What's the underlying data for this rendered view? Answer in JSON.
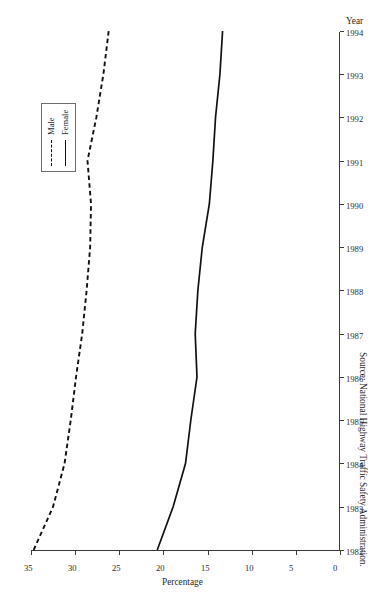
{
  "chart_data": {
    "type": "line",
    "title": "",
    "xlabel": "Year",
    "ylabel": "Percentage",
    "orientation": "rotated-90-ccw",
    "grid": false,
    "legend_position": "top-left-of-image",
    "x": [
      1982,
      1983,
      1984,
      1985,
      1986,
      1987,
      1988,
      1989,
      1990,
      1991,
      1992,
      1993,
      1994
    ],
    "xlim": [
      1982,
      1994
    ],
    "ylim": [
      0,
      35
    ],
    "xticks": [
      "1982",
      "1983",
      "1984",
      "1985",
      "1986",
      "1987",
      "1988",
      "1989",
      "1990",
      "1991",
      "1992",
      "1993",
      "1994"
    ],
    "yticks": [
      "0",
      "5",
      "10",
      "15",
      "20",
      "25",
      "30",
      "35"
    ],
    "series": [
      {
        "name": "Male",
        "style": "dashed",
        "color": "#111111",
        "values": [
          34.7,
          32.5,
          31.2,
          30.5,
          29.9,
          29.2,
          28.7,
          28.3,
          28.2,
          28.6,
          27.6,
          26.8,
          26.2
        ]
      },
      {
        "name": "Female",
        "style": "solid",
        "color": "#111111",
        "values": [
          20.7,
          18.9,
          17.5,
          16.9,
          16.2,
          16.4,
          16.1,
          15.6,
          14.8,
          14.4,
          14.1,
          13.6,
          13.3
        ]
      }
    ]
  },
  "legend": {
    "items": [
      {
        "label": "Male",
        "style": "dashed"
      },
      {
        "label": "Female",
        "style": "solid"
      }
    ]
  },
  "axes": {
    "x_title": "Year",
    "y_title": "Percentage"
  },
  "source": {
    "text": "Source: National Highway Traffic Safety Administration."
  }
}
